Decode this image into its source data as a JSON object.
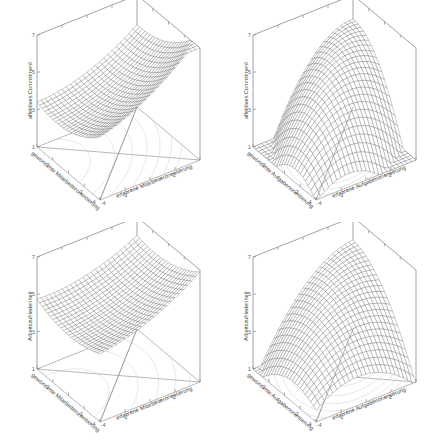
{
  "figure": {
    "panels": 4
  },
  "chart_data": [
    {
      "type": "surface",
      "position": "top-left",
      "zlabel": "affektives Commitment",
      "xlabel": "erfahrene Mitarbeiterorientierung",
      "ylabel": "gewünschte Mitarbeiterorientierung",
      "xlim": [
        -4,
        4
      ],
      "ylim": [
        -4,
        4
      ],
      "zlim": [
        1,
        7
      ],
      "zticks": [
        "1",
        "3",
        "5",
        "7"
      ],
      "xticks": [
        "-4",
        "-2",
        "0",
        "2",
        "4"
      ],
      "yticks": [
        "-4",
        "-2",
        "0",
        "2",
        "4"
      ],
      "surface_coefficients": {
        "b0": 4.1,
        "b1": 0.33,
        "b2": -0.2,
        "b3": 0.03,
        "b4": -0.02,
        "b5": 0.04
      },
      "shape": "tilted sheet rising toward back corner"
    },
    {
      "type": "surface",
      "position": "top-right",
      "zlabel": "affektives Commitment",
      "xlabel": "erfahrene Aufgabenorientierung",
      "ylabel": "gewünschte Aufgabenorientierung",
      "xlim": [
        -4,
        4
      ],
      "ylim": [
        -4,
        4
      ],
      "zlim": [
        1,
        7
      ],
      "zticks": [
        "1",
        "3",
        "5",
        "7"
      ],
      "xticks": [
        "-4",
        "-2",
        "0",
        "2",
        "4"
      ],
      "yticks": [
        "-4",
        "-2",
        "0",
        "2",
        "4"
      ],
      "surface_coefficients": {
        "b0": 4.6,
        "b1": 0.3,
        "b2": 0.3,
        "b3": -0.12,
        "b4": 0.16,
        "b5": -0.12
      },
      "shape": "ridge peaking at back corner along the congruence line"
    },
    {
      "type": "surface",
      "position": "bottom-left",
      "zlabel": "Arbeitszufriedenheit",
      "xlabel": "erfahrene Mitarbeiterorientierung",
      "ylabel": "gewünschte Mitarbeiterorientierung",
      "xlim": [
        -4,
        4
      ],
      "ylim": [
        -4,
        4
      ],
      "zlim": [
        1,
        7
      ],
      "zticks": [
        "1",
        "3",
        "5",
        "7"
      ],
      "xticks": [
        "-4",
        "-2",
        "0",
        "2",
        "4"
      ],
      "yticks": [
        "-4",
        "-2",
        "0",
        "2",
        "4"
      ],
      "surface_coefficients": {
        "b0": 4.7,
        "b1": 0.22,
        "b2": -0.05,
        "b3": 0.025,
        "b4": -0.015,
        "b5": 0.03
      },
      "shape": "gently tilted sheet rising toward back corner"
    },
    {
      "type": "surface",
      "position": "bottom-right",
      "zlabel": "Arbeitszufriedenheit",
      "xlabel": "erfahrene Aufgabenorientierung",
      "ylabel": "gewünschte Aufgabenorientierung",
      "xlim": [
        -4,
        4
      ],
      "ylim": [
        -4,
        4
      ],
      "zlim": [
        1,
        7
      ],
      "zticks": [
        "1",
        "3",
        "5",
        "7"
      ],
      "xticks": [
        "-4",
        "-2",
        "0",
        "2",
        "4"
      ],
      "yticks": [
        "-4",
        "-2",
        "0",
        "2",
        "4"
      ],
      "surface_coefficients": {
        "b0": 4.5,
        "b1": 0.3,
        "b2": 0.22,
        "b3": -0.08,
        "b4": 0.1,
        "b5": -0.07
      },
      "shape": "ridge rising toward back corner"
    }
  ]
}
